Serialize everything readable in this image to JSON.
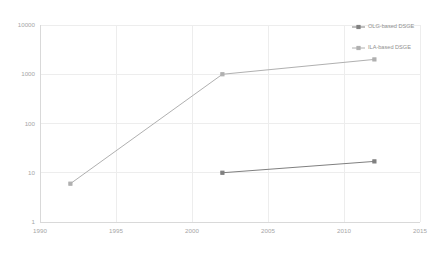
{
  "chart_data": {
    "type": "line",
    "title": "",
    "subtitle": "",
    "xlabel": "",
    "ylabel": "",
    "yscale": "log",
    "xlim": [
      1990,
      2015
    ],
    "ylim": [
      1,
      10000
    ],
    "grid": true,
    "legend_position": "top-right",
    "xticks": [
      "1990",
      "1995",
      "2000",
      "2005",
      "2010",
      "2015"
    ],
    "xtick_values": [
      1990,
      1995,
      2000,
      2005,
      2010,
      2015
    ],
    "yticks": [
      "1",
      "10",
      "100",
      "1000",
      "10000"
    ],
    "ytick_values": [
      1,
      10,
      100,
      1000,
      10000
    ],
    "series": [
      {
        "name": "OLG-based DSGE",
        "color": "#808080",
        "marker": "square",
        "x": [
          2002,
          2012
        ],
        "values": [
          10,
          17
        ]
      },
      {
        "name": "ILA-based DSGE",
        "color": "#b0b0b0",
        "marker": "square",
        "x": [
          1992,
          2002,
          2012
        ],
        "values": [
          6,
          1000,
          2000
        ]
      }
    ]
  },
  "legend": {
    "items": [
      {
        "label": "OLG-based DSGE",
        "color": "#808080"
      },
      {
        "label": "ILA-based DSGE",
        "color": "#b0b0b0"
      }
    ]
  },
  "colors": {
    "background": "#ffffff",
    "grid": "#ededed",
    "axis": "#d9d9d9",
    "tick_label": "#a6a6a6",
    "legend_label": "#8f8f8f"
  }
}
